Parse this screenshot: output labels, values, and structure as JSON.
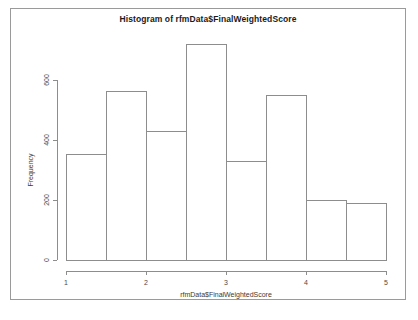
{
  "chart_data": {
    "type": "bar",
    "title": "Histogram of rfmData$FinalWeightedScore",
    "xlabel": "rfmData$FinalWeightedScore",
    "ylabel": "Frequency",
    "grid": false,
    "legend": false,
    "xlim": [
      1,
      5
    ],
    "ylim": [
      0,
      720
    ],
    "xticks": [
      "1",
      "2",
      "3",
      "4",
      "5"
    ],
    "xtick_values": [
      1,
      2,
      3,
      4,
      5
    ],
    "yticks": [
      "0",
      "200",
      "400",
      "600"
    ],
    "ytick_values": [
      0,
      200,
      400,
      600
    ],
    "bin_width": 0.5,
    "bin_edges": [
      1,
      1.5,
      2,
      2.5,
      3,
      3.5,
      4,
      4.5,
      5
    ],
    "categories": [
      "1-1.5",
      "1.5-2",
      "2-2.5",
      "2.5-3",
      "3-3.5",
      "3.5-4",
      "4-4.5",
      "4.5-5"
    ],
    "values": [
      353,
      563,
      430,
      720,
      330,
      550,
      197,
      190
    ]
  },
  "colors": {
    "bar_fill": "#ffffff",
    "bar_stroke": "#8d8d8d",
    "axis": "#8d8d8d",
    "title_text": "#1b1b1b",
    "label_text": "#4a4a4a",
    "frame": "#9a9a9a",
    "background": "#ffffff"
  }
}
